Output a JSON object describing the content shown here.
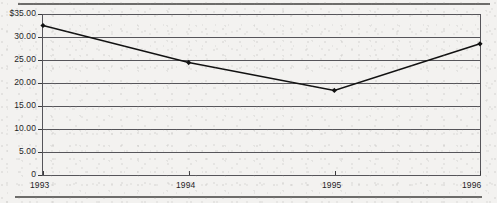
{
  "chart_data": {
    "type": "line",
    "title": "",
    "subtitle": "",
    "xlabel": "",
    "ylabel": "",
    "categories": [
      "1993",
      "1994",
      "1995",
      "1996"
    ],
    "x_tick_labels": [
      "1993",
      "1994",
      "1995",
      "1996"
    ],
    "y_tick_labels": [
      "$35.00",
      "30.00",
      "25.00",
      "20.00",
      "15.00",
      "10.00",
      "5.00",
      "0"
    ],
    "y_tick_values": [
      35,
      30,
      25,
      20,
      15,
      10,
      5,
      0
    ],
    "ylim": [
      0,
      35
    ],
    "grid": true,
    "legend": false,
    "legend_position": "none",
    "marker": "diamond",
    "series": [
      {
        "name": "",
        "values": [
          32.7,
          24.6,
          18.5,
          28.7
        ],
        "color": "#111111"
      }
    ]
  },
  "style": {
    "line_color": "#111111",
    "axis_color": "#56555a",
    "grid_color": "#56555a",
    "text_color": "#1d1d1f",
    "rule_color": "#6d6c6a",
    "page_background": "#f3f2f0"
  }
}
